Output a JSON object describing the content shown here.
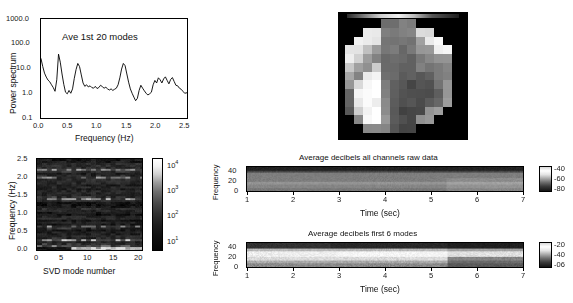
{
  "figure": {
    "panels": [
      "power-spectrum",
      "pixel-map",
      "svd-spectrogram",
      "raw-spectrogram",
      "modes-spectrogram"
    ]
  },
  "panel_a": {
    "annotation": "Ave 1st 20 modes",
    "xlabel": "Frequency (Hz)",
    "ylabel": "Power spectrum",
    "xticks": [
      "0.0",
      "0.5",
      "1.0",
      "1.5",
      "2.0",
      "2.5"
    ],
    "yticks": [
      "1000.0",
      "100.0",
      "10.0",
      "1.0",
      "0.1"
    ]
  },
  "panel_c": {
    "xlabel": "SVD mode number",
    "ylabel": "Frequency (Hz)",
    "xticks": [
      "0",
      "5",
      "10",
      "15",
      "20"
    ],
    "yticks": [
      "2.5",
      "2.0",
      "1.5",
      "1.0",
      "0.5",
      "0.0"
    ],
    "cbticks": [
      "10",
      "10",
      "10",
      "10"
    ],
    "cbexp": [
      "4",
      "3",
      "2",
      "1"
    ]
  },
  "panel_d": {
    "title": "Average decibels all channels raw data",
    "xlabel": "Time (sec)",
    "ylabel": "Frequency",
    "xticks": [
      "1",
      "2",
      "3",
      "4",
      "5",
      "6",
      "7"
    ],
    "yticks": [
      "40",
      "20",
      "0"
    ],
    "cbticks": [
      "-40",
      "-60",
      "-80"
    ]
  },
  "panel_e": {
    "title": "Average decibels first 6 modes",
    "xlabel": "Time (sec)",
    "ylabel": "Frequency",
    "xticks": [
      "1",
      "2",
      "3",
      "4",
      "5",
      "6",
      "7"
    ],
    "yticks": [
      "40",
      "20",
      "0"
    ],
    "cbticks": [
      "-20",
      "-40",
      "-06"
    ]
  },
  "chart_data": [
    {
      "type": "line",
      "id": "power-spectrum",
      "title": "Ave 1st 20 modes",
      "xlabel": "Frequency (Hz)",
      "ylabel": "Power spectrum",
      "xlim": [
        0.0,
        2.5
      ],
      "ylim": [
        0.1,
        1000.0
      ],
      "yscale": "log",
      "grid": false,
      "x": [
        0.0,
        0.03,
        0.06,
        0.09,
        0.12,
        0.15,
        0.18,
        0.21,
        0.24,
        0.27,
        0.3,
        0.33,
        0.36,
        0.39,
        0.42,
        0.45,
        0.48,
        0.51,
        0.54,
        0.57,
        0.6,
        0.63,
        0.66,
        0.69,
        0.72,
        0.75,
        0.78,
        0.81,
        0.84,
        0.87,
        0.9,
        0.93,
        0.96,
        0.99,
        1.02,
        1.05,
        1.08,
        1.11,
        1.14,
        1.17,
        1.2,
        1.23,
        1.26,
        1.29,
        1.32,
        1.35,
        1.38,
        1.41,
        1.44,
        1.47,
        1.5,
        1.53,
        1.56,
        1.59,
        1.62,
        1.65,
        1.68,
        1.71,
        1.74,
        1.77,
        1.8,
        1.83,
        1.86,
        1.89,
        1.92,
        1.95,
        1.98,
        2.01,
        2.04,
        2.07,
        2.1,
        2.13,
        2.16,
        2.19,
        2.22,
        2.25,
        2.28,
        2.31,
        2.34,
        2.37,
        2.4,
        2.43,
        2.46,
        2.5
      ],
      "y": [
        25,
        12,
        6.5,
        4.5,
        3.4,
        2.9,
        2.2,
        1.7,
        1.2,
        3.5,
        38,
        18,
        6,
        2.3,
        1.1,
        0.95,
        1.3,
        1.0,
        1.5,
        4.0,
        9.0,
        16,
        12,
        5.5,
        2.6,
        1.9,
        2.2,
        1.8,
        2.0,
        1.7,
        1.6,
        1.9,
        1.55,
        1.7,
        2.1,
        1.85,
        1.6,
        1.75,
        1.5,
        1.35,
        1.5,
        1.3,
        1.45,
        1.6,
        2.2,
        4.2,
        9.5,
        16,
        13,
        6.0,
        2.8,
        1.5,
        1.0,
        0.7,
        0.5,
        0.62,
        1.3,
        2.1,
        1.6,
        1.25,
        1.0,
        0.85,
        0.95,
        1.1,
        2.2,
        3.3,
        2.6,
        4.2,
        3.5,
        2.6,
        3.8,
        4.6,
        3.3,
        2.4,
        3.6,
        4.3,
        3.0,
        2.1,
        2.0,
        1.6,
        1.45,
        1.2,
        1.0,
        1.05
      ],
      "annotations": [
        "Ave 1st 20 modes"
      ]
    },
    {
      "type": "heatmap",
      "id": "svd-spectrogram",
      "xlabel": "SVD mode number",
      "ylabel": "Frequency (Hz)",
      "xlim": [
        0,
        20
      ],
      "ylim": [
        0.0,
        2.5
      ],
      "cscale": "log",
      "clim": [
        10,
        10000
      ],
      "cbticks": [
        "10^1",
        "10^2",
        "10^3",
        "10^4"
      ],
      "bright_bands_hz": [
        0.15,
        0.3,
        0.65,
        1.42,
        2.0,
        2.2
      ],
      "note": "dark background with horizontal bright bands at spectral peak frequencies"
    },
    {
      "type": "heatmap",
      "id": "raw-spectrogram",
      "title": "Average decibels all channels raw data",
      "xlabel": "Time (sec)",
      "ylabel": "Frequency",
      "xlim": [
        1,
        7
      ],
      "ylim": [
        0,
        45
      ],
      "clim": [
        -80,
        -40
      ],
      "cbticks": [
        "-40",
        "-60",
        "-80"
      ]
    },
    {
      "type": "heatmap",
      "id": "modes-spectrogram",
      "title": "Average decibels first 6 modes",
      "xlabel": "Time (sec)",
      "ylabel": "Frequency",
      "xlim": [
        1,
        7
      ],
      "ylim": [
        0,
        45
      ],
      "clim": [
        -60,
        -20
      ],
      "cbticks": [
        "-20",
        "-40",
        "-06"
      ],
      "transition_time_sec": 5.35
    }
  ]
}
